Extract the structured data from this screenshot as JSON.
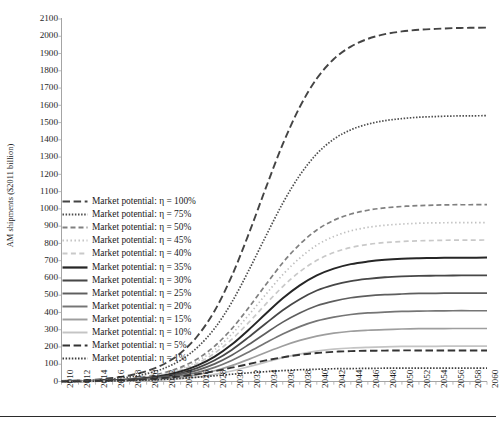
{
  "axes": {
    "ylabel": "AM shipments ($2011 billion)",
    "xlabel": "",
    "y_ticks": [
      0,
      100,
      200,
      300,
      400,
      500,
      600,
      700,
      800,
      900,
      1000,
      1100,
      1200,
      1300,
      1400,
      1500,
      1600,
      1700,
      1800,
      1900,
      2000,
      2100
    ],
    "x_ticks": [
      2010,
      2012,
      2014,
      2016,
      2018,
      2020,
      2022,
      2024,
      2026,
      2028,
      2030,
      2032,
      2034,
      2036,
      2038,
      2040,
      2042,
      2044,
      2046,
      2048,
      2050,
      2052,
      2054,
      2056,
      2058,
      2060
    ]
  },
  "legend": {
    "position": "inside-left",
    "entries": [
      {
        "label": "Market potential: η = 100%",
        "style": "long-dash",
        "color": "#444444"
      },
      {
        "label": "Market potential: η = 75%",
        "style": "fine-dot",
        "color": "#4d4d4d"
      },
      {
        "label": "Market potential: η = 50%",
        "style": "dash",
        "color": "#808080"
      },
      {
        "label": "Market potential: η = 45%",
        "style": "sparse-dot",
        "color": "#bfbfbf"
      },
      {
        "label": "Market potential: η = 40%",
        "style": "light-dash",
        "color": "#c9c9c9"
      },
      {
        "label": "Market potential: η = 35%",
        "style": "solid-thick",
        "color": "#262626"
      },
      {
        "label": "Market potential: η = 30%",
        "style": "solid",
        "color": "#474747"
      },
      {
        "label": "Market potential: η = 25%",
        "style": "solid",
        "color": "#5e5e5e"
      },
      {
        "label": "Market potential: η = 20%",
        "style": "solid",
        "color": "#757575"
      },
      {
        "label": "Market potential: η = 15%",
        "style": "solid",
        "color": "#9e9e9e"
      },
      {
        "label": "Market potential: η = 10%",
        "style": "solid",
        "color": "#c4c4c4"
      },
      {
        "label": "Market potential: η = 5%",
        "style": "long-dash",
        "color": "#333333"
      },
      {
        "label": "Market potential: η = 1%",
        "style": "fine-dot",
        "color": "#3d3d3d"
      }
    ]
  },
  "chart_data": {
    "type": "line",
    "title": "",
    "xlabel": "",
    "ylabel": "AM shipments ($2011 billion)",
    "xlim": [
      2010,
      2060
    ],
    "ylim": [
      0,
      2100
    ],
    "grid": false,
    "x": [
      2010,
      2012,
      2014,
      2016,
      2018,
      2020,
      2022,
      2024,
      2026,
      2028,
      2030,
      2032,
      2034,
      2036,
      2038,
      2040,
      2042,
      2044,
      2046,
      2048,
      2050,
      2052,
      2054,
      2056,
      2058,
      2060
    ],
    "series": [
      {
        "name": "Market potential: η = 100%",
        "eta_percent": 100,
        "saturation": 2050,
        "style": "long-dash",
        "color": "#444444",
        "width": 1.9,
        "values": [
          3,
          6,
          11,
          20,
          35,
          60,
          100,
          165,
          265,
          410,
          610,
          855,
          1120,
          1375,
          1590,
          1755,
          1868,
          1940,
          1985,
          2012,
          2028,
          2038,
          2043,
          2047,
          2049,
          2050
        ]
      },
      {
        "name": "Market potential: η = 75%",
        "eta_percent": 75,
        "saturation": 1540,
        "style": "fine-dot",
        "color": "#4d4d4d",
        "width": 1.7,
        "values": [
          2,
          5,
          8,
          15,
          26,
          45,
          75,
          124,
          199,
          308,
          458,
          643,
          841,
          1033,
          1195,
          1319,
          1404,
          1458,
          1491,
          1511,
          1523,
          1531,
          1535,
          1538,
          1539,
          1540
        ]
      },
      {
        "name": "Market potential: η = 50%",
        "eta_percent": 50,
        "saturation": 1025,
        "style": "dash",
        "color": "#808080",
        "width": 1.7,
        "values": [
          1,
          3,
          6,
          10,
          17,
          30,
          50,
          82,
          132,
          205,
          305,
          428,
          560,
          688,
          795,
          878,
          934,
          970,
          992,
          1006,
          1014,
          1019,
          1022,
          1024,
          1024,
          1025
        ]
      },
      {
        "name": "Market potential: η = 45%",
        "eta_percent": 45,
        "saturation": 920,
        "style": "sparse-dot",
        "color": "#bfbfbf",
        "width": 1.7,
        "values": [
          1,
          3,
          5,
          9,
          16,
          27,
          45,
          74,
          119,
          184,
          274,
          385,
          504,
          619,
          715,
          790,
          840,
          873,
          893,
          905,
          912,
          917,
          919,
          920,
          920,
          920
        ]
      },
      {
        "name": "Market potential: η = 40%",
        "eta_percent": 40,
        "saturation": 820,
        "style": "light-dash",
        "color": "#c9c9c9",
        "width": 1.7,
        "values": [
          1,
          2,
          5,
          8,
          14,
          24,
          40,
          66,
          106,
          164,
          244,
          342,
          448,
          550,
          636,
          702,
          747,
          776,
          794,
          805,
          811,
          815,
          817,
          819,
          819,
          820
        ]
      },
      {
        "name": "Market potential: η = 35%",
        "eta_percent": 35,
        "saturation": 718,
        "style": "solid-thick",
        "color": "#262626",
        "width": 2.0,
        "values": [
          1,
          2,
          4,
          7,
          12,
          21,
          35,
          58,
          93,
          144,
          214,
          300,
          392,
          482,
          557,
          615,
          654,
          680,
          695,
          705,
          711,
          714,
          716,
          717,
          717,
          718
        ]
      },
      {
        "name": "Market potential: η = 30%",
        "eta_percent": 30,
        "saturation": 615,
        "style": "solid",
        "color": "#474747",
        "width": 1.8,
        "values": [
          1,
          2,
          3,
          6,
          10,
          18,
          30,
          49,
          79,
          123,
          183,
          257,
          336,
          413,
          477,
          527,
          560,
          582,
          595,
          604,
          609,
          612,
          613,
          614,
          615,
          615
        ]
      },
      {
        "name": "Market potential: η = 25%",
        "eta_percent": 25,
        "saturation": 512,
        "style": "solid",
        "color": "#5e5e5e",
        "width": 1.7,
        "values": [
          1,
          1,
          3,
          5,
          9,
          15,
          25,
          41,
          66,
          102,
          152,
          214,
          280,
          344,
          397,
          439,
          466,
          485,
          496,
          503,
          507,
          510,
          511,
          512,
          512,
          512
        ]
      },
      {
        "name": "Market potential: η = 20%",
        "eta_percent": 20,
        "saturation": 410,
        "style": "solid",
        "color": "#757575",
        "width": 1.7,
        "values": [
          0,
          1,
          2,
          4,
          7,
          12,
          20,
          33,
          53,
          82,
          122,
          171,
          224,
          275,
          318,
          351,
          373,
          388,
          397,
          402,
          406,
          408,
          409,
          410,
          410,
          410
        ]
      },
      {
        "name": "Market potential: η = 15%",
        "eta_percent": 15,
        "saturation": 307,
        "style": "solid",
        "color": "#9e9e9e",
        "width": 1.7,
        "values": [
          0,
          1,
          2,
          3,
          5,
          9,
          15,
          25,
          40,
          62,
          92,
          128,
          168,
          206,
          238,
          263,
          280,
          291,
          297,
          301,
          304,
          306,
          306,
          307,
          307,
          307
        ]
      },
      {
        "name": "Market potential: η = 10%",
        "eta_percent": 10,
        "saturation": 205,
        "style": "solid",
        "color": "#c4c4c4",
        "width": 1.7,
        "values": [
          0,
          0,
          1,
          2,
          3,
          6,
          10,
          16,
          26,
          41,
          61,
          86,
          112,
          138,
          159,
          176,
          187,
          194,
          198,
          201,
          203,
          204,
          204,
          205,
          205,
          205
        ]
      },
      {
        "name": "Market potential: η = 5%",
        "eta_percent": 5,
        "saturation": 180,
        "style": "long-dash",
        "color": "#333333",
        "width": 1.9,
        "values": [
          1,
          2,
          3,
          5,
          8,
          13,
          20,
          30,
          43,
          60,
          80,
          101,
          122,
          140,
          155,
          165,
          172,
          176,
          178,
          179,
          180,
          180,
          180,
          180,
          180,
          180
        ]
      },
      {
        "name": "Market potential: η = 1%",
        "eta_percent": 1,
        "saturation": 78,
        "style": "fine-dot",
        "color": "#3d3d3d",
        "width": 1.7,
        "values": [
          0,
          1,
          2,
          3,
          5,
          8,
          12,
          18,
          25,
          33,
          42,
          50,
          57,
          63,
          68,
          71,
          74,
          75,
          76,
          77,
          77,
          78,
          78,
          78,
          78,
          78
        ]
      }
    ]
  }
}
